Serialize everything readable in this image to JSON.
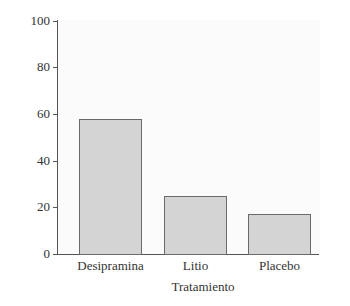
{
  "chart_data": {
    "type": "bar",
    "title": "",
    "xlabel": "Tratamiento",
    "ylabel": "Porcentaje de éxitos",
    "categories": [
      "Desipramina",
      "Litio",
      "Placebo"
    ],
    "values": [
      58,
      25,
      17
    ],
    "ylim": [
      0,
      100
    ],
    "yticks": [
      0,
      20,
      40,
      60,
      80,
      100
    ],
    "grid": false,
    "legend": null,
    "bar_color": "#d4d4d4",
    "bar_edge_color": "#6a6a6a"
  },
  "labels": {
    "xlabel": "Tratamiento",
    "ylabel": "Porcentaje de éxitos",
    "yticks": [
      "0",
      "20",
      "40",
      "60",
      "80",
      "100"
    ],
    "categories": [
      "Desipramina",
      "Litio",
      "Placebo"
    ]
  }
}
